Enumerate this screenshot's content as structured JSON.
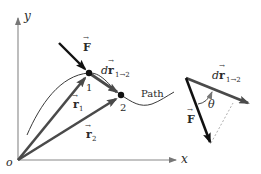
{
  "diagram": {
    "axes": {
      "x_label": "x",
      "y_label": "y",
      "origin_label": "o"
    },
    "path_label": "Path",
    "points": [
      {
        "label": "1",
        "x": 89,
        "y": 73
      },
      {
        "label": "2",
        "x": 121,
        "y": 95
      }
    ],
    "vectors": {
      "force": {
        "label": "F",
        "arrow": "→"
      },
      "r1": {
        "label": "r",
        "sub": "1",
        "arrow": "→"
      },
      "r2": {
        "label": "r",
        "sub": "2",
        "arrow": "→"
      },
      "dr": {
        "prefix": "d",
        "label": "r",
        "sub": "1→2",
        "arrow": "→"
      }
    },
    "inset": {
      "force_label": "F",
      "dr_prefix": "d",
      "dr_label": "r",
      "dr_sub": "1→2",
      "angle_label": "θ"
    },
    "colors": {
      "ink": "#1a1a1a",
      "vector_gray": "#4a4a4a",
      "axis": "#888888",
      "path": "#3a3a3a",
      "dashed": "#999999"
    }
  }
}
